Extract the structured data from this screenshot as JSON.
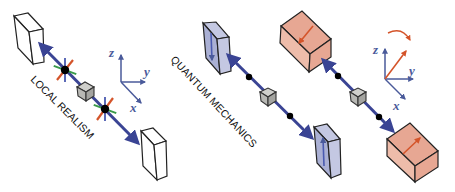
{
  "panels": [
    {
      "id": "local-realism",
      "label": "LOCAL REALISM",
      "axes": {
        "x": "x",
        "y": "y",
        "z": "z"
      },
      "detectors": [
        "white-box-top-left",
        "white-box-bottom-right"
      ],
      "source": "grey-cube",
      "particles": 2
    },
    {
      "id": "quantum-mechanics",
      "label": "QUANTUM MECHANICS",
      "detectors": [
        "blue-polarizer-top",
        "blue-polarizer-bottom"
      ],
      "source": "grey-cube",
      "particles": 2
    },
    {
      "id": "rotated-measurement",
      "axes": {
        "x": "x",
        "y": "y",
        "z": "z"
      },
      "detectors": [
        "red-polarizer-top",
        "red-polarizer-bottom"
      ],
      "source": "grey-cube",
      "particles": 2,
      "rotation_arrow": true
    }
  ],
  "colors": {
    "beam": "#3a4494",
    "white_box": "#ffffff",
    "blue_box": "#aab0d4",
    "blue_box_side": "#c4c8e2",
    "red_box": "#e7a793",
    "red_box_side": "#eebcaa",
    "source_cube": "#b8b8b4",
    "particle": "#000000",
    "spin_red": "#d4542a",
    "spin_green": "#3a9a4a",
    "spin_blue": "#4a5ab0",
    "axis": "#4a5a9a",
    "rotated_axis": "#d4542a"
  }
}
